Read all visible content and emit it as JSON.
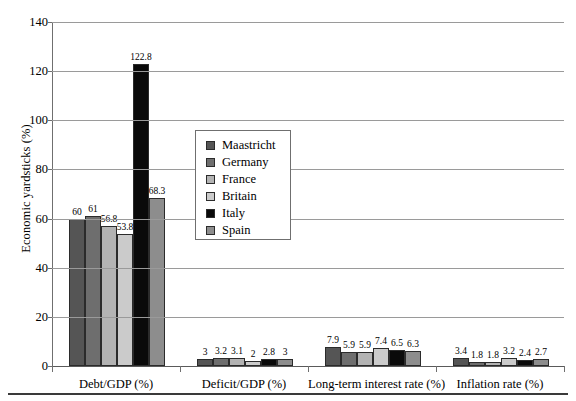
{
  "chart_data": {
    "type": "bar",
    "title": "",
    "subtitle": "",
    "xlabel": "",
    "ylabel": "Economic yardsticks (%)",
    "ylim": [
      0,
      140
    ],
    "ytick_values": [
      0,
      20,
      40,
      60,
      80,
      100,
      120,
      140
    ],
    "ytick_labels": [
      "0",
      "20",
      "40",
      "60",
      "80",
      "100",
      "120",
      "140"
    ],
    "grid": "horizontal",
    "legend_position": "center-left-inside",
    "categories": [
      "Debt/GDP (%)",
      "Deficit/GDP (%)",
      "Long-term interest rate (%)",
      "Inflation rate (%)"
    ],
    "series": [
      {
        "name": "Maastricht",
        "color": "#555555",
        "values": [
          60,
          3,
          7.9,
          3.4
        ],
        "labels": [
          "60",
          "3",
          "7.9",
          "3.4"
        ]
      },
      {
        "name": "Germany",
        "color": "#6e6e6e",
        "values": [
          61,
          3.2,
          5.9,
          1.8
        ],
        "labels": [
          "61",
          "3.2",
          "5.9",
          "1.8"
        ]
      },
      {
        "name": "France",
        "color": "#b3b3b3",
        "values": [
          56.8,
          3.1,
          5.9,
          1.8
        ],
        "labels": [
          "56.8",
          "3.1",
          "5.9",
          "1.8"
        ]
      },
      {
        "name": "Britain",
        "color": "#cbcbcb",
        "values": [
          53.8,
          2,
          7.4,
          3.2
        ],
        "labels": [
          "53.8",
          "2",
          "7.4",
          "3.2"
        ]
      },
      {
        "name": "Italy",
        "color": "#0a0a0a",
        "values": [
          122.8,
          2.8,
          6.5,
          2.4
        ],
        "labels": [
          "122.8",
          "2.8",
          "6.5",
          "2.4"
        ]
      },
      {
        "name": "Spain",
        "color": "#8d8d8d",
        "values": [
          68.3,
          3,
          6.3,
          2.7
        ],
        "labels": [
          "68.3",
          "3",
          "6.3",
          "2.7"
        ]
      }
    ]
  },
  "axis": {
    "y_title": "Economic yardsticks (%)"
  }
}
